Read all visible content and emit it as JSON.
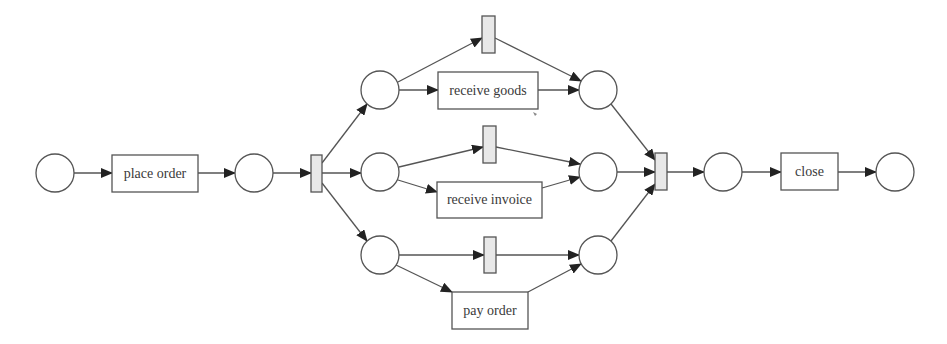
{
  "diagram": {
    "type": "petri-net",
    "colors": {
      "stroke": "#555555",
      "silent_fill": "#e8e8e8",
      "background": "#ffffff",
      "text": "#3a3a3a"
    },
    "places": [
      {
        "id": "p_start",
        "cx": 55,
        "cy": 173,
        "r": 19
      },
      {
        "id": "p1",
        "cx": 254,
        "cy": 173,
        "r": 19
      },
      {
        "id": "p_g_in",
        "cx": 380,
        "cy": 90,
        "r": 19
      },
      {
        "id": "p_i_in",
        "cx": 380,
        "cy": 172,
        "r": 19
      },
      {
        "id": "p_p_in",
        "cx": 380,
        "cy": 255,
        "r": 19
      },
      {
        "id": "p_g_out",
        "cx": 598,
        "cy": 90,
        "r": 19
      },
      {
        "id": "p_i_out",
        "cx": 598,
        "cy": 172,
        "r": 19
      },
      {
        "id": "p_p_out",
        "cx": 598,
        "cy": 255,
        "r": 19
      },
      {
        "id": "p2",
        "cx": 723,
        "cy": 172,
        "r": 19
      },
      {
        "id": "p_end",
        "cx": 895,
        "cy": 172,
        "r": 19
      }
    ],
    "transitions": [
      {
        "id": "t_place_order",
        "label": "place order",
        "x": 112,
        "y": 155,
        "w": 86,
        "h": 37,
        "silent": false
      },
      {
        "id": "t_split",
        "label": "",
        "x": 311,
        "y": 155,
        "w": 11,
        "h": 37,
        "silent": true
      },
      {
        "id": "t_skip_goods",
        "label": "",
        "x": 482,
        "y": 16,
        "w": 13,
        "h": 37,
        "silent": true
      },
      {
        "id": "t_recv_goods",
        "label": "receive goods",
        "x": 438,
        "y": 72,
        "w": 100,
        "h": 37,
        "silent": false
      },
      {
        "id": "t_skip_invoice",
        "label": "",
        "x": 483,
        "y": 126,
        "w": 13,
        "h": 37,
        "silent": true
      },
      {
        "id": "t_recv_invoice",
        "label": "receive invoice",
        "x": 437,
        "y": 182,
        "w": 105,
        "h": 36,
        "silent": false
      },
      {
        "id": "t_skip_pay",
        "label": "",
        "x": 484,
        "y": 237,
        "w": 12,
        "h": 36,
        "silent": true
      },
      {
        "id": "t_pay_order",
        "label": "pay order",
        "x": 452,
        "y": 292,
        "w": 76,
        "h": 37,
        "silent": false
      },
      {
        "id": "t_join",
        "label": "",
        "x": 655,
        "y": 153,
        "w": 12,
        "h": 37,
        "silent": true
      },
      {
        "id": "t_close",
        "label": "close",
        "x": 781,
        "y": 153,
        "w": 57,
        "h": 37,
        "silent": false
      }
    ],
    "arcs": [
      {
        "from": [
          74,
          173
        ],
        "to": [
          112,
          173
        ]
      },
      {
        "from": [
          198,
          173
        ],
        "to": [
          235,
          173
        ]
      },
      {
        "from": [
          273,
          173
        ],
        "to": [
          311,
          173
        ]
      },
      {
        "from": [
          322,
          163
        ],
        "to": [
          367,
          104
        ]
      },
      {
        "from": [
          322,
          173
        ],
        "to": [
          361,
          173
        ]
      },
      {
        "from": [
          322,
          183
        ],
        "to": [
          367,
          241
        ]
      },
      {
        "from": [
          398,
          82
        ],
        "to": [
          482,
          38
        ]
      },
      {
        "from": [
          399,
          90
        ],
        "to": [
          438,
          90
        ]
      },
      {
        "from": [
          495,
          38
        ],
        "to": [
          581,
          81
        ]
      },
      {
        "from": [
          538,
          90
        ],
        "to": [
          579,
          90
        ]
      },
      {
        "from": [
          399,
          167
        ],
        "to": [
          483,
          147
        ]
      },
      {
        "from": [
          398,
          180
        ],
        "to": [
          437,
          192
        ]
      },
      {
        "from": [
          496,
          147
        ],
        "to": [
          580,
          164
        ]
      },
      {
        "from": [
          542,
          188
        ],
        "to": [
          580,
          177
        ]
      },
      {
        "from": [
          399,
          255
        ],
        "to": [
          484,
          255
        ]
      },
      {
        "from": [
          396,
          265
        ],
        "to": [
          452,
          292
        ]
      },
      {
        "from": [
          496,
          255
        ],
        "to": [
          579,
          255
        ]
      },
      {
        "from": [
          528,
          292
        ],
        "to": [
          581,
          264
        ]
      },
      {
        "from": [
          611,
          104
        ],
        "to": [
          655,
          160
        ]
      },
      {
        "from": [
          617,
          172
        ],
        "to": [
          655,
          172
        ]
      },
      {
        "from": [
          611,
          241
        ],
        "to": [
          655,
          184
        ]
      },
      {
        "from": [
          667,
          172
        ],
        "to": [
          704,
          172
        ]
      },
      {
        "from": [
          742,
          172
        ],
        "to": [
          781,
          172
        ]
      },
      {
        "from": [
          838,
          172
        ],
        "to": [
          876,
          172
        ]
      }
    ]
  }
}
